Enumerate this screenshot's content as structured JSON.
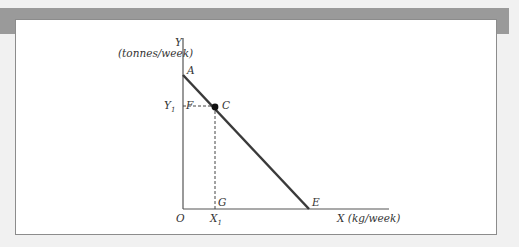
{
  "figure": {
    "type": "diagram",
    "y_axis": {
      "label": "Y",
      "unit": "(tonnes/week)"
    },
    "x_axis": {
      "label": "X (kg/week)"
    },
    "origin_label": "O",
    "points": {
      "A": "A",
      "C": "C",
      "E": "E",
      "F": "F",
      "G": "G"
    },
    "ticks": {
      "y1": "Y",
      "y1_sub": "1",
      "x1": "X",
      "x1_sub": "1"
    },
    "colors": {
      "line": "#3a3a3a",
      "axis": "#555555",
      "header_bar": "#9a9a9a",
      "background": "#f1f1f1"
    }
  }
}
